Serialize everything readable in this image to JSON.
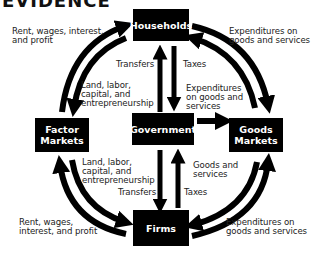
{
  "title": "EVIDENCE",
  "nodes": {
    "households": "Households",
    "factor_markets": "Factor\nMarkets",
    "government": "Government",
    "goods_markets": "Goods\nMarkets",
    "firms": "Firms"
  },
  "labels": {
    "top_left": "Rent, wages, interest,\nand profit",
    "top_right": "Expenditures on\ngoods and services",
    "hh_transfers": "Transfers",
    "hh_taxes": "Taxes",
    "left_upper": "Land, labor,\ncapital, and\nentrepreneurship",
    "gov_expenditures": "Expenditures\non goods and\nservices",
    "left_lower": "Land, labor,\ncapital, and\nentrepreneurship",
    "goods_services": "Goods and\nservices",
    "firm_transfers": "Transfers",
    "firm_taxes": "Taxes",
    "bottom_left": "Rent, wages,\ninterest, and profit",
    "bottom_right": "Expenditures on\ngoods and services"
  },
  "colors": {
    "box": "#000000",
    "arrow": "#000000",
    "text": "#222222"
  }
}
